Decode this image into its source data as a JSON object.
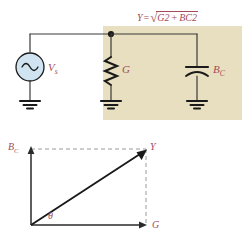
{
  "figure": {
    "formula": {
      "lhs": "Y",
      "equals": "=",
      "radical": "√",
      "term1_base": "G",
      "term1_exp": "2",
      "plus": "+",
      "term2_base": "B",
      "term2_sub": "C",
      "term2_exp": "2",
      "full_text": "Y = √(G² + BC²)"
    },
    "colors": {
      "label_red": "#a24b5a",
      "panel_beige": "#e7dfbf",
      "wire_black": "#3a3a3a",
      "source_fill": "#cfe3f0",
      "source_stroke": "#1a1a1a",
      "dashed_gray": "#9a9a9a"
    },
    "circuit": {
      "source": {
        "label_base": "V",
        "label_sub": "s",
        "icon": "ac-source-sine-icon"
      },
      "components": [
        {
          "name": "conductance",
          "label_base": "G",
          "label_sub": "",
          "icon": "resistor-zigzag-icon"
        },
        {
          "name": "capacitive-susceptance",
          "label_base": "B",
          "label_sub": "C",
          "icon": "capacitor-curved-icon"
        }
      ],
      "grounds": 3,
      "node_dot": true
    },
    "phasor": {
      "vertical_axis_base": "B",
      "vertical_axis_sub": "C",
      "horizontal_axis": "G",
      "resultant": "Y",
      "angle": "θ"
    }
  }
}
